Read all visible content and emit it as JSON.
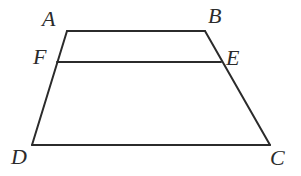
{
  "figure": {
    "background_color": "#ffffff",
    "stroke_color": "#2b2b2b",
    "label_color": "#2b2b2b",
    "stroke_width": 2,
    "labels": {
      "A": "A",
      "B": "B",
      "C": "C",
      "D": "D",
      "E": "E",
      "F": "F"
    },
    "points": {
      "A": {
        "x": 67,
        "y": 31
      },
      "B": {
        "x": 205,
        "y": 31
      },
      "C": {
        "x": 270,
        "y": 145
      },
      "D": {
        "x": 32,
        "y": 145
      },
      "E": {
        "x": 221,
        "y": 62
      },
      "F": {
        "x": 57,
        "y": 62
      }
    },
    "segments": [
      {
        "name": "AB",
        "from": "A",
        "to": "B",
        "d": "M 67 31 L 205 31"
      },
      {
        "name": "BC",
        "from": "B",
        "to": "C",
        "d": "M 205 31 L 270 145"
      },
      {
        "name": "CD",
        "from": "C",
        "to": "D",
        "d": "M 270 145 L 32 145"
      },
      {
        "name": "DA",
        "from": "D",
        "to": "A",
        "d": "M 32 145 L 67 31"
      },
      {
        "name": "FE",
        "from": "F",
        "to": "E",
        "d": "M 57 62 L 221 62"
      }
    ]
  }
}
